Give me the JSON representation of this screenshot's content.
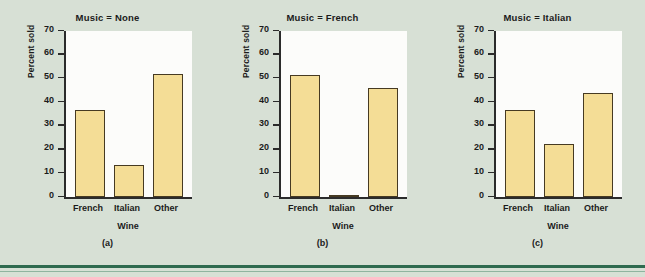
{
  "figure": {
    "background_color": "#d7e0d5",
    "plot_background_color": "#fcfcfa",
    "bar_fill_color": "#f4dd96",
    "bar_edge_color": "#463a22",
    "axis_color": "#2b2b2b",
    "rule_color": "#2f6b4f"
  },
  "chart_data": [
    {
      "type": "bar",
      "title": "Music = None",
      "caption": "(a)",
      "xlabel": "Wine",
      "ylabel": "Percent sold",
      "categories": [
        "French",
        "Italian",
        "Other"
      ],
      "values": [
        36.5,
        13.5,
        52
      ],
      "ylim": [
        0,
        70
      ],
      "yticks": [
        0,
        10,
        20,
        30,
        40,
        50,
        60,
        70
      ],
      "ytick_labels": [
        "0",
        "10",
        "20",
        "30",
        "40",
        "50",
        "60",
        "70"
      ],
      "grid": false,
      "legend": null
    },
    {
      "type": "bar",
      "title": "Music = French",
      "caption": "(b)",
      "xlabel": "Wine",
      "ylabel": "Percent sold",
      "categories": [
        "French",
        "Italian",
        "Other"
      ],
      "values": [
        51.5,
        1,
        46
      ],
      "ylim": [
        0,
        70
      ],
      "yticks": [
        0,
        10,
        20,
        30,
        40,
        50,
        60,
        70
      ],
      "ytick_labels": [
        "0",
        "10",
        "20",
        "30",
        "40",
        "50",
        "60",
        "70"
      ],
      "grid": false,
      "legend": null
    },
    {
      "type": "bar",
      "title": "Music = Italian",
      "caption": "(c)",
      "xlabel": "Wine",
      "ylabel": "Percent sold",
      "categories": [
        "French",
        "Italian",
        "Other"
      ],
      "values": [
        36.5,
        22.5,
        44
      ],
      "ylim": [
        0,
        70
      ],
      "yticks": [
        0,
        10,
        20,
        30,
        40,
        50,
        60,
        70
      ],
      "ytick_labels": [
        "0",
        "10",
        "20",
        "30",
        "40",
        "50",
        "60",
        "70"
      ],
      "grid": false,
      "legend": null
    }
  ]
}
